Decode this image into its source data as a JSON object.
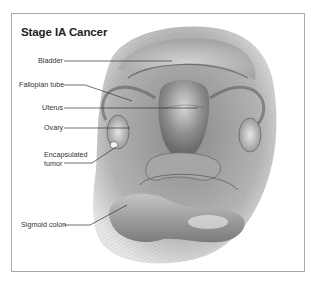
{
  "figure": {
    "title": "Stage IA Cancer",
    "labels": [
      {
        "id": "bladder",
        "text": "Bladder"
      },
      {
        "id": "fallopian-tube",
        "text": "Fallopian tube"
      },
      {
        "id": "uterus",
        "text": "Uterus"
      },
      {
        "id": "ovary",
        "text": "Ovary"
      },
      {
        "id": "encapsulated-tumor",
        "text": "Encapsulated tumor",
        "line1": "Encapsulated",
        "line2": "tumor"
      },
      {
        "id": "sigmoid-colon",
        "text": "Sigmoid colon"
      }
    ],
    "colors": {
      "frame": "#a8a8a8",
      "leader_line": "#333333",
      "illustration_tone": "#9a9a9a"
    }
  }
}
